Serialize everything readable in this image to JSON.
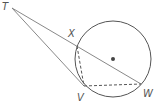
{
  "diagram": {
    "type": "geometry-secant-tangent",
    "colors": {
      "stroke": "#6b6b6b",
      "circle": "#555555",
      "dot": "#444444",
      "label": "#555555"
    },
    "circle": {
      "cx": 113,
      "cy": 59,
      "r": 38
    },
    "points": {
      "T": {
        "label": "T",
        "x": 12,
        "y": 8,
        "lx": 2,
        "ly": 10
      },
      "X": {
        "label": "X",
        "x": 77,
        "y": 46,
        "lx": 68,
        "ly": 37
      },
      "W": {
        "label": "W",
        "x": 141,
        "y": 84,
        "lx": 143,
        "ly": 97
      },
      "V": {
        "label": "V",
        "x": 84,
        "y": 86,
        "lx": 77,
        "ly": 101
      }
    },
    "segments": {
      "solid": [
        "TW",
        "TV"
      ],
      "dashed": [
        "XV",
        "VW"
      ]
    }
  }
}
